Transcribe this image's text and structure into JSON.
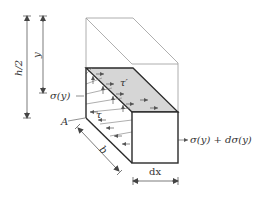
{
  "figure": {
    "type": "beam element free-body diagram",
    "labels": {
      "h_half": "h/2",
      "y": "y",
      "sigma_left": "σ(y)",
      "tau": "τ",
      "tau_prime": "τ′",
      "A": "A",
      "b": "b",
      "sigma_right": "σ(y) + dσ(y)",
      "dx": "dx"
    },
    "colors": {
      "stroke_main": "#2a2a2a",
      "stroke_light": "#9a9a9a",
      "shaded_face": "#d6d6d6",
      "text": "#333333"
    }
  }
}
